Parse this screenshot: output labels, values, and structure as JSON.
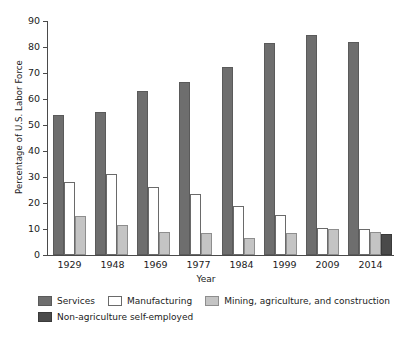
{
  "chart_data": {
    "type": "bar",
    "title": "",
    "xlabel": "Year",
    "ylabel": "Percentage of U.S. Labor Force",
    "ylim": [
      0,
      90
    ],
    "ytick_step": 10,
    "yticks": [
      90,
      80,
      70,
      60,
      50,
      40,
      30,
      20,
      10,
      0
    ],
    "grid": false,
    "legend_position": "bottom-left",
    "categories": [
      "1929",
      "1948",
      "1969",
      "1977",
      "1984",
      "1999",
      "2009",
      "2014"
    ],
    "series": [
      {
        "name": "Services",
        "color": "#6e6e6e",
        "values": [
          54,
          55,
          63,
          66.5,
          72.5,
          81.5,
          84.5,
          82
        ]
      },
      {
        "name": "Manufacturing",
        "color": "#ffffff",
        "values": [
          28,
          31,
          26,
          23.5,
          19,
          15.5,
          10.5,
          10
        ]
      },
      {
        "name": "Mining, agriculture, and construction",
        "color": "#c4c4c4",
        "values": [
          15,
          11.5,
          9,
          8.5,
          6.5,
          8.5,
          10,
          9
        ]
      },
      {
        "name": "Non-agriculture self-employed",
        "color": "#4a4a4a",
        "values": [
          null,
          null,
          null,
          null,
          null,
          null,
          null,
          8
        ]
      }
    ]
  },
  "legend": {
    "row1": [
      {
        "label": "Services",
        "swatch": "s1"
      },
      {
        "label": "Manufacturing",
        "swatch": "s2"
      },
      {
        "label": "Mining, agriculture, and construction",
        "swatch": "s3"
      }
    ],
    "row2": [
      {
        "label": "Non-agriculture self-employed",
        "swatch": "s4"
      }
    ]
  }
}
